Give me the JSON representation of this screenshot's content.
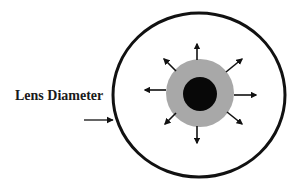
{
  "diagram": {
    "label": "Lens Diameter",
    "colors": {
      "background": "#ffffff",
      "outline": "#111111",
      "ring": "#a8a8a8",
      "core": "#080808",
      "arrow": "#111111"
    },
    "outer_lens": {
      "cx": 199,
      "cy": 95,
      "rx": 86,
      "ry": 82,
      "stroke_width": 3
    },
    "ring": {
      "cx": 200,
      "cy": 93,
      "r": 34
    },
    "core": {
      "cx": 200,
      "cy": 94,
      "r": 17
    },
    "pointer_arrow": {
      "x1": 84,
      "y1": 120,
      "x2": 113,
      "y2": 120
    },
    "radial_arrows": [
      {
        "direction": "up",
        "x1": 197,
        "y1": 60,
        "x2": 197,
        "y2": 44
      },
      {
        "direction": "up-right",
        "x1": 226,
        "y1": 72,
        "x2": 242,
        "y2": 59
      },
      {
        "direction": "right",
        "x1": 234,
        "y1": 95,
        "x2": 256,
        "y2": 95
      },
      {
        "direction": "down-right",
        "x1": 227,
        "y1": 112,
        "x2": 242,
        "y2": 124
      },
      {
        "direction": "down",
        "x1": 197,
        "y1": 126,
        "x2": 197,
        "y2": 143
      },
      {
        "direction": "down-left",
        "x1": 176,
        "y1": 113,
        "x2": 165,
        "y2": 124
      },
      {
        "direction": "left",
        "x1": 166,
        "y1": 90,
        "x2": 145,
        "y2": 90
      },
      {
        "direction": "up-left",
        "x1": 176,
        "y1": 71,
        "x2": 164,
        "y2": 59
      }
    ]
  }
}
